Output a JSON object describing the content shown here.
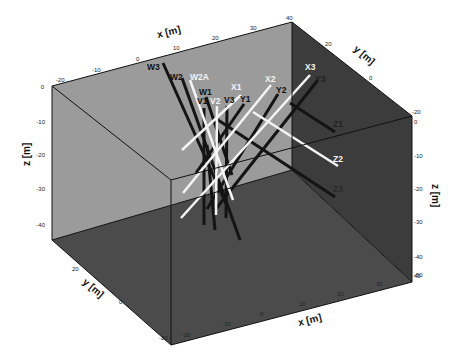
{
  "figure": {
    "type": "3d-borehole-box",
    "colors": {
      "background": "#ffffff",
      "back_wall": "#9a9a9a",
      "right_wall": "#3a3a3a",
      "floor": "#4a4a4a",
      "edge": "#111111",
      "black_borehole": "#141414",
      "white_borehole": "#f4f4f4"
    },
    "axes": {
      "x_top": {
        "label": "x [m]",
        "ticks": [
          "-20",
          "-10",
          "0",
          "10",
          "20",
          "30",
          "40"
        ]
      },
      "y_top": {
        "label": "y [m]",
        "ticks": [
          "20",
          "0",
          "-20"
        ]
      },
      "z_left": {
        "label": "z [m]",
        "ticks": [
          "0",
          "-10",
          "-20",
          "-30",
          "-40"
        ]
      },
      "z_right": {
        "label": "z [m]",
        "ticks": [
          "0",
          "-10",
          "-20",
          "-30",
          "-40",
          "-50"
        ]
      },
      "y_bottom": {
        "label": "y [m]",
        "ticks": [
          "20",
          "0",
          "-20"
        ]
      },
      "x_bottom": {
        "label": "x [m]",
        "ticks": [
          "-20",
          "-10",
          "0",
          "10",
          "20",
          "30",
          "40"
        ]
      }
    },
    "boreholes": [
      {
        "name": "W3",
        "color": "black"
      },
      {
        "name": "W2",
        "color": "black"
      },
      {
        "name": "W2A",
        "color": "white"
      },
      {
        "name": "W1",
        "color": "black"
      },
      {
        "name": "V1",
        "color": "black"
      },
      {
        "name": "V2",
        "color": "white"
      },
      {
        "name": "V3",
        "color": "black"
      },
      {
        "name": "X1",
        "color": "white"
      },
      {
        "name": "Y1",
        "color": "black"
      },
      {
        "name": "X2",
        "color": "white"
      },
      {
        "name": "Y2",
        "color": "black"
      },
      {
        "name": "X3",
        "color": "white"
      },
      {
        "name": "Y3",
        "color": "black"
      },
      {
        "name": "Z1",
        "color": "black"
      },
      {
        "name": "Z2",
        "color": "white"
      },
      {
        "name": "Z3",
        "color": "black"
      }
    ]
  }
}
